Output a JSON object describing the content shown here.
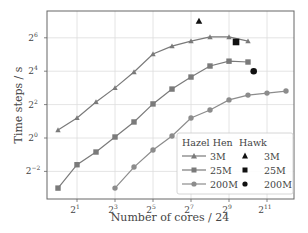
{
  "chart_data": {
    "type": "line",
    "title": "",
    "xlabel": "Number of cores / 24",
    "ylabel": "Time steps / s",
    "xscale": "log2",
    "yscale": "log2",
    "xlim_log2": [
      -0.6,
      12.6
    ],
    "ylim_log2": [
      -3.6,
      7.6
    ],
    "x_ticks": [
      {
        "base": "2",
        "exp": "1",
        "log2": 1
      },
      {
        "base": "2",
        "exp": "3",
        "log2": 3
      },
      {
        "base": "2",
        "exp": "5",
        "log2": 5
      },
      {
        "base": "2",
        "exp": "7",
        "log2": 7
      },
      {
        "base": "2",
        "exp": "9",
        "log2": 9
      },
      {
        "base": "2",
        "exp": "11",
        "log2": 11
      }
    ],
    "y_ticks": [
      {
        "base": "2",
        "exp": "6",
        "log2": 6
      },
      {
        "base": "2",
        "exp": "4",
        "log2": 4
      },
      {
        "base": "2",
        "exp": "2",
        "log2": 2
      },
      {
        "base": "2",
        "exp": "0",
        "log2": 0
      },
      {
        "base": "2",
        "exp": "−2",
        "log2": -2
      }
    ],
    "grid": true,
    "legend_position": "lower right",
    "legend_groups": [
      "Hazel Hen",
      "Hawk"
    ],
    "series": [
      {
        "name": "Hazel Hen 3M",
        "group": "Hazel Hen",
        "label": "3M",
        "marker": "triangle",
        "line": true,
        "color": "#7a7a7a",
        "x_log2": [
          0,
          1,
          2,
          3,
          4,
          5,
          6,
          7,
          8,
          9,
          10
        ],
        "y_log2": [
          0.48,
          1.2,
          2.16,
          3.0,
          3.95,
          5.03,
          5.5,
          5.8,
          6.05,
          6.05,
          5.8
        ]
      },
      {
        "name": "Hazel Hen 25M",
        "group": "Hazel Hen",
        "label": "25M",
        "marker": "square",
        "line": true,
        "color": "#7a7a7a",
        "x_log2": [
          0,
          1,
          2,
          3,
          4,
          5,
          6,
          7,
          8,
          9,
          10
        ],
        "y_log2": [
          -3.0,
          -1.6,
          -0.84,
          0.06,
          0.96,
          2.04,
          2.93,
          3.65,
          4.31,
          4.6,
          4.55
        ]
      },
      {
        "name": "Hazel Hen 200M",
        "group": "Hazel Hen",
        "label": "200M",
        "marker": "circle",
        "line": true,
        "color": "#8c8c8c",
        "x_log2": [
          3,
          4,
          5,
          6,
          7,
          8,
          9,
          10,
          11,
          12
        ],
        "y_log2": [
          -3.0,
          -1.74,
          -0.72,
          0.12,
          1.2,
          1.68,
          2.28,
          2.57,
          2.69,
          2.81
        ]
      },
      {
        "name": "Hawk 3M",
        "group": "Hawk",
        "label": "3M",
        "marker": "triangle",
        "line": false,
        "color": "#111111",
        "x_log2": [
          7.42
        ],
        "y_log2": [
          7.0
        ]
      },
      {
        "name": "Hawk 25M",
        "group": "Hawk",
        "label": "25M",
        "marker": "square",
        "line": false,
        "color": "#111111",
        "x_log2": [
          9.37
        ],
        "y_log2": [
          5.75
        ]
      },
      {
        "name": "Hawk 200M",
        "group": "Hawk",
        "label": "200M",
        "marker": "circle",
        "line": false,
        "color": "#111111",
        "x_log2": [
          10.3
        ],
        "y_log2": [
          4.0
        ]
      }
    ]
  },
  "legend": {
    "hazel_hen_title": "Hazel Hen",
    "hawk_title": "Hawk",
    "rows": [
      {
        "hazel_label": "3M",
        "hawk_label": "3M"
      },
      {
        "hazel_label": "25M",
        "hawk_label": "25M"
      },
      {
        "hazel_label": "200M",
        "hawk_label": "200M"
      }
    ]
  },
  "colors": {
    "axis": "#666666",
    "grid": "#dddddd",
    "series_line": "#7a7a7a",
    "hawk_marker": "#111111"
  }
}
